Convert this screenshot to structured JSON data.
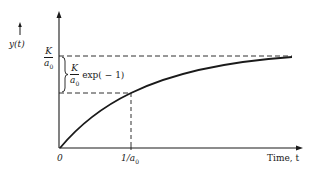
{
  "diagram": {
    "y_axis_label": "y(t)",
    "x_axis_label": "Time, t",
    "origin_label": "0",
    "x_tick_label": {
      "numerator": "1/a",
      "subscript": "0"
    },
    "asymptote_label": {
      "numerator": "K",
      "denominator": "a",
      "subscript": "0"
    },
    "brace_label": {
      "numerator": "K",
      "denominator": "a",
      "subscript": "0",
      "suffix": "exp( − 1)"
    },
    "curve": "y(t) = (K/a0)(1 − exp(−a0 t))",
    "colors": {
      "ink": "#1a1a1a",
      "background": "#ffffff"
    }
  }
}
